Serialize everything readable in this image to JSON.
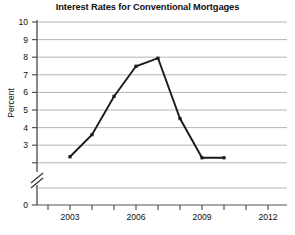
{
  "chart_data": {
    "type": "line",
    "title": "Interest Rates for Conventional Mortgages",
    "xlabel": "",
    "ylabel": "Percent",
    "x": [
      2003,
      2004,
      2005,
      2006,
      2007,
      2008,
      2009,
      2010
    ],
    "values": [
      3.3,
      4.4,
      6.3,
      7.8,
      8.2,
      5.2,
      3.25,
      3.25
    ],
    "series": [
      {
        "name": "Interest Rate",
        "values": [
          3.3,
          4.4,
          6.3,
          7.8,
          8.2,
          5.2,
          3.25,
          3.25
        ]
      }
    ],
    "ylim": [
      0,
      10
    ],
    "yticks": [
      0,
      3,
      4,
      5,
      6,
      7,
      8,
      9,
      10
    ],
    "ytick_labels": [
      "0",
      "3",
      "4",
      "5",
      "6",
      "7",
      "8",
      "9",
      "10"
    ],
    "y_axis_break": true,
    "y_axis_break_between": [
      0,
      3
    ],
    "xlim": [
      2002,
      2013
    ],
    "xticks": [
      2002,
      2003,
      2004,
      2005,
      2006,
      2007,
      2008,
      2009,
      2010,
      2011,
      2012,
      2013
    ],
    "xtick_labels": [
      "2003",
      "2006",
      "2009",
      "2012"
    ],
    "labeled_xticks": [
      2003,
      2006,
      2009,
      2012
    ],
    "grid": true,
    "grid_axis": "y",
    "legend": false,
    "legend_position": "none",
    "line_color": "#1a1a1a",
    "grid_color": "#b0b0b0",
    "axis_color": "#4d4d4d",
    "marker": "square"
  }
}
